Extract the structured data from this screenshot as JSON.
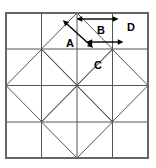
{
  "figure": {
    "type": "geometric-diagram",
    "background_color": "#ffffff",
    "line_color": "#555555",
    "border_color": "#666666",
    "arrow_color": "#000000"
  },
  "frame": {
    "x": 6,
    "y": 13,
    "width": 142,
    "height": 145,
    "stroke_width": 2
  },
  "grid": {
    "vertical_lines": [
      41.5,
      77,
      112.5
    ],
    "horizontal_lines": [
      49,
      85.5,
      122
    ],
    "stroke_width": 1
  },
  "diamonds": [
    {
      "name": "diamond-top-center",
      "cx": 77,
      "cy": 49,
      "rx": 35.5,
      "ry": 36
    },
    {
      "name": "diamond-left-center",
      "cx": 41.5,
      "cy": 85.5,
      "rx": 35.5,
      "ry": 36
    },
    {
      "name": "diamond-right-center",
      "cx": 112.5,
      "cy": 85.5,
      "rx": 35.5,
      "ry": 36
    },
    {
      "name": "diamond-bottom-center",
      "cx": 77,
      "cy": 122,
      "rx": 35.5,
      "ry": 36
    }
  ],
  "labels": [
    {
      "name": "label-a",
      "text": "A",
      "x": 70,
      "y": 44
    },
    {
      "name": "label-b",
      "text": "B",
      "x": 101,
      "y": 31
    },
    {
      "name": "label-c",
      "text": "C",
      "x": 98,
      "y": 66
    },
    {
      "name": "label-d",
      "text": "D",
      "x": 131,
      "y": 28
    }
  ],
  "arrows": [
    {
      "name": "arrow-diagonal-a",
      "label_ref": "A",
      "orientation": "diagonal",
      "x1": 67,
      "y1": 24,
      "x2": 89,
      "y2": 44,
      "double_headed": true
    },
    {
      "name": "arrow-horizontal-b-top",
      "label_ref": "B",
      "orientation": "horizontal",
      "x1": 82,
      "y1": 19,
      "x2": 113,
      "y2": 19,
      "double_headed": true
    },
    {
      "name": "arrow-horizontal-b-bottom",
      "label_ref": "B",
      "orientation": "horizontal",
      "x1": 92,
      "y1": 42,
      "x2": 118,
      "y2": 42,
      "double_headed": true
    }
  ]
}
